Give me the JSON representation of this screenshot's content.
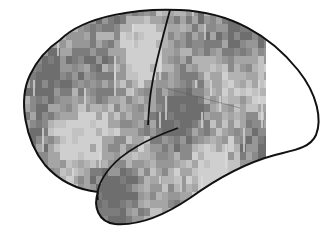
{
  "figure": {
    "background": "#ffffff",
    "outline_color": "#111111",
    "mosaic_grays": [
      "#6e6e6e",
      "#7c7c7c",
      "#8a8a8a",
      "#979797",
      "#a5a5a5",
      "#b3b3b3",
      "#c2c2c2",
      "#cfcfcf"
    ],
    "mosaic_right_edge_px": 266,
    "cell_px": 8
  }
}
